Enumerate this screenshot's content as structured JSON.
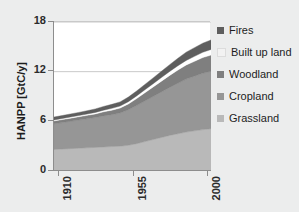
{
  "chart_data": {
    "type": "area",
    "stacked": true,
    "title": "",
    "xlabel": "",
    "ylabel": "HANPP [GtC/y]",
    "xlim": [
      1910,
      2005
    ],
    "ylim": [
      0,
      18
    ],
    "yticks": [
      0,
      6,
      12,
      18
    ],
    "ytick_labels": [
      "0",
      "6",
      "12",
      "18"
    ],
    "xticks": [
      1910,
      1955,
      2000
    ],
    "xtick_labels": [
      "1910",
      "1955",
      "2000"
    ],
    "grid": "horizontal-major",
    "legend_position": "right",
    "x": [
      1910,
      1915,
      1920,
      1925,
      1930,
      1935,
      1940,
      1945,
      1950,
      1955,
      1960,
      1965,
      1970,
      1975,
      1980,
      1985,
      1990,
      1995,
      2000,
      2005
    ],
    "series": [
      {
        "name": "Grassland",
        "color": "#b9b9b9",
        "values": [
          2.6,
          2.65,
          2.7,
          2.75,
          2.8,
          2.85,
          2.9,
          2.95,
          3.0,
          3.1,
          3.3,
          3.55,
          3.8,
          4.05,
          4.3,
          4.5,
          4.7,
          4.85,
          5.0,
          5.1
        ]
      },
      {
        "name": "Cropland",
        "color": "#969696",
        "values": [
          3.1,
          3.2,
          3.3,
          3.4,
          3.5,
          3.6,
          3.75,
          3.85,
          4.0,
          4.3,
          4.6,
          4.9,
          5.2,
          5.5,
          5.8,
          6.1,
          6.4,
          6.6,
          6.8,
          6.95
        ]
      },
      {
        "name": "Woodland",
        "color": "#7f7f7f",
        "values": [
          0.35,
          0.36,
          0.38,
          0.4,
          0.42,
          0.45,
          0.5,
          0.55,
          0.6,
          0.7,
          0.85,
          1.0,
          1.15,
          1.3,
          1.45,
          1.6,
          1.7,
          1.8,
          1.9,
          1.95
        ]
      },
      {
        "name": "Built up land",
        "color": "#ffffff",
        "values": [
          0.12,
          0.13,
          0.14,
          0.15,
          0.16,
          0.18,
          0.2,
          0.22,
          0.25,
          0.28,
          0.32,
          0.36,
          0.4,
          0.44,
          0.48,
          0.52,
          0.56,
          0.6,
          0.64,
          0.68
        ]
      },
      {
        "name": "Fires",
        "color": "#5e5e5e",
        "values": [
          0.35,
          0.36,
          0.37,
          0.38,
          0.4,
          0.42,
          0.45,
          0.48,
          0.5,
          0.55,
          0.6,
          0.65,
          0.7,
          0.75,
          0.82,
          0.9,
          1.0,
          1.05,
          1.1,
          1.15
        ]
      }
    ],
    "totals": [
      6.52,
      6.7,
      6.89,
      7.08,
      7.28,
      7.5,
      7.8,
      8.05,
      8.35,
      8.93,
      9.67,
      10.46,
      11.25,
      12.04,
      12.85,
      13.62,
      14.36,
      14.9,
      15.44,
      15.83
    ]
  },
  "axes": {
    "y_title": "HANPP [GtC/y]",
    "y_tick_labels": [
      "18",
      "12",
      "6",
      "0"
    ],
    "x_tick_labels": [
      "1910",
      "1955",
      "2000"
    ]
  },
  "legend": {
    "items": [
      {
        "label": "Fires",
        "color": "#5e5e5e"
      },
      {
        "label": "Built up land",
        "color": "#f2f2f2"
      },
      {
        "label": "Woodland",
        "color": "#7f7f7f"
      },
      {
        "label": "Cropland",
        "color": "#969696"
      },
      {
        "label": "Grassland",
        "color": "#b9b9b9"
      }
    ]
  },
  "colors": {
    "background": "#eceded",
    "plot_background": "#ffffff",
    "axis": "#8d8d8d",
    "gridline": "#c9c9c9",
    "text": "#1d1d1d"
  }
}
